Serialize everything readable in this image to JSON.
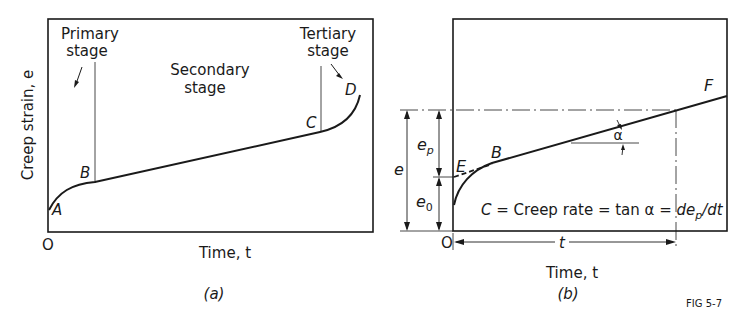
{
  "figure_label": "FIG 5-7",
  "panel_a": {
    "caption": "(a)",
    "y_axis_label": "Creep strain, e",
    "x_axis_label": "Time, t",
    "origin_label": "O",
    "stage_labels": {
      "primary_line1": "Primary",
      "primary_line2": "stage",
      "secondary_line1": "Secondary",
      "secondary_line2": "stage",
      "tertiary_line1": "Tertiary",
      "tertiary_line2": "stage"
    },
    "points": {
      "A": "A",
      "B": "B",
      "C": "C",
      "D": "D"
    }
  },
  "panel_b": {
    "caption": "(b)",
    "x_axis_label": "Time, t",
    "origin_label": "O",
    "time_span_label": "t",
    "dimension_labels": {
      "e": "e",
      "e_p": "e",
      "e_p_sub": "p",
      "e_0": "e",
      "e_0_sub": "0"
    },
    "angle_label": "α",
    "points": {
      "E": "E",
      "B": "B",
      "F": "F"
    },
    "equation": {
      "lhs": "C",
      "text": " = Creep rate = tan α = ",
      "rhs_d1": "de",
      "rhs_sub": "p",
      "rhs_d2": "/dt"
    }
  },
  "colors": {
    "ink": "#1a1a1a",
    "background": "#ffffff"
  }
}
